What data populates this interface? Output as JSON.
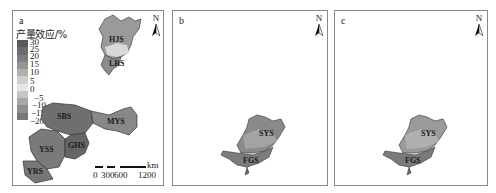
{
  "panels": [
    {
      "id": "a",
      "label": "a",
      "north_label": "N",
      "legend": {
        "title": "产量效应/%",
        "ticks": [
          "30",
          "25",
          "20",
          "15",
          "10",
          "5",
          "0",
          "−5",
          "−10",
          "−15",
          "−20"
        ],
        "colors": [
          "#5a5a5a",
          "#6c6c6c",
          "#7e7e7e",
          "#959595",
          "#b0b0b0",
          "#cfcfcf",
          "#e6e6e6",
          "#c4c4c4",
          "#a8a8a8",
          "#8e8e8e",
          "#777777"
        ]
      },
      "regions": [
        "HJS",
        "LRS",
        "SBS",
        "MYS",
        "YSS",
        "GHS",
        "YRS"
      ],
      "scale_bar": {
        "labels": [
          "0",
          "300",
          "600",
          "1200"
        ],
        "unit": "km"
      }
    },
    {
      "id": "b",
      "label": "b",
      "north_label": "N",
      "regions": [
        "SYS",
        "FGS"
      ]
    },
    {
      "id": "c",
      "label": "c",
      "north_label": "N",
      "regions": [
        "SYS",
        "FGS"
      ]
    }
  ]
}
